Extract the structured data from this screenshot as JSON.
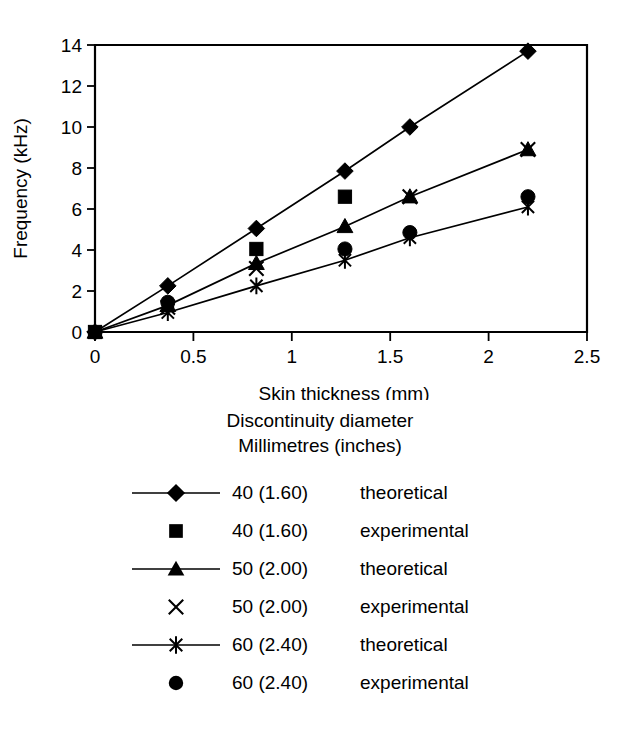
{
  "chart_data": {
    "type": "line",
    "title": "",
    "xlabel": "Skin thickness (mm)",
    "ylabel": "Frequency (kHz)",
    "xlim": [
      0,
      2.5
    ],
    "ylim": [
      0,
      14
    ],
    "xticks": [
      "0",
      "0.5",
      "1",
      "1.5",
      "2",
      "2.5"
    ],
    "xtick_values": [
      0,
      0.5,
      1,
      1.5,
      2,
      2.5
    ],
    "yticks": [
      "0",
      "2",
      "4",
      "6",
      "8",
      "10",
      "12",
      "14"
    ],
    "ytick_values": [
      0,
      2,
      4,
      6,
      8,
      10,
      12,
      14
    ],
    "grid": false,
    "legend_position": "below-plot",
    "legend_title_line1": "Discontinuity diameter",
    "legend_title_line2": "Millimetres (inches)",
    "series": [
      {
        "name": "40 (1.60) theoretical",
        "diameter": "40 (1.60)",
        "kind": "theoretical",
        "marker": "diamond",
        "line": true,
        "x": [
          0,
          0.37,
          0.82,
          1.27,
          1.6,
          2.2
        ],
        "values": [
          0,
          2.25,
          5.05,
          7.85,
          10.0,
          13.7
        ]
      },
      {
        "name": "40 (1.60) experimental",
        "diameter": "40 (1.60)",
        "kind": "experimental",
        "marker": "square",
        "line": false,
        "x": [
          0,
          0.82,
          1.27
        ],
        "values": [
          0,
          4.05,
          6.6
        ]
      },
      {
        "name": "50 (2.00) theoretical",
        "diameter": "50 (2.00)",
        "kind": "theoretical",
        "marker": "triangle",
        "line": true,
        "x": [
          0,
          0.37,
          0.82,
          1.27,
          1.6,
          2.2
        ],
        "values": [
          0,
          1.3,
          3.35,
          5.15,
          6.6,
          8.9
        ]
      },
      {
        "name": "50 (2.00) experimental",
        "diameter": "50 (2.00)",
        "kind": "experimental",
        "marker": "x",
        "line": false,
        "x": [
          0.37,
          0.82,
          1.6,
          2.2
        ],
        "values": [
          1.2,
          3.1,
          6.6,
          8.9
        ]
      },
      {
        "name": "60 (2.40) theoretical",
        "diameter": "60 (2.40)",
        "kind": "theoretical",
        "marker": "star",
        "line": true,
        "x": [
          0,
          0.37,
          0.82,
          1.27,
          1.6,
          2.2
        ],
        "values": [
          0,
          0.95,
          2.25,
          3.5,
          4.6,
          6.1
        ]
      },
      {
        "name": "60 (2.40) experimental",
        "diameter": "60 (2.40)",
        "kind": "experimental",
        "marker": "circle",
        "line": false,
        "x": [
          0.37,
          1.27,
          1.6,
          2.2
        ],
        "values": [
          1.45,
          4.05,
          4.85,
          6.6
        ]
      }
    ]
  },
  "legend": {
    "title_line1": "Discontinuity diameter",
    "title_line2": "Millimetres (inches)",
    "rows": [
      {
        "marker": "diamond",
        "line": true,
        "diameter": "40 (1.60)",
        "kind": "theoretical"
      },
      {
        "marker": "square",
        "line": false,
        "diameter": "40 (1.60)",
        "kind": "experimental"
      },
      {
        "marker": "triangle",
        "line": true,
        "diameter": "50 (2.00)",
        "kind": "theoretical"
      },
      {
        "marker": "x",
        "line": false,
        "diameter": "50 (2.00)",
        "kind": "experimental"
      },
      {
        "marker": "star",
        "line": true,
        "diameter": "60 (2.40)",
        "kind": "theoretical"
      },
      {
        "marker": "circle",
        "line": false,
        "diameter": "60 (2.40)",
        "kind": "experimental"
      }
    ]
  },
  "colors": {
    "ink": "#000000",
    "background": "#ffffff"
  }
}
